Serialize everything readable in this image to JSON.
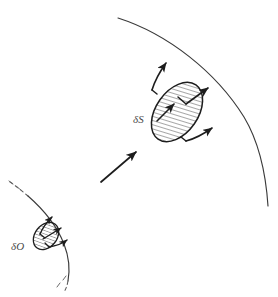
{
  "figure": {
    "background_color": "#ffffff",
    "stroke_color": "#262626",
    "curve_color": "#3a3a3a",
    "label_color": "#4a4a4a",
    "hatch_color": "#3a3a3a",
    "width": 278,
    "height": 297
  },
  "labels": {
    "surface_element": "δS",
    "solid_angle_element": "δO"
  },
  "elements": {
    "upper_arc": {
      "name": "outer-surface-arc",
      "style": "solid",
      "start": [
        118,
        18
      ],
      "end": [
        268,
        206
      ]
    },
    "lower_arc": {
      "name": "inner-surface-arc",
      "style": "dashed-ends",
      "start": [
        10,
        182
      ],
      "end": [
        74,
        292
      ]
    },
    "large_ellipse": {
      "name": "surface-area-patch",
      "center": [
        177,
        112
      ],
      "rx": 21,
      "ry": 33,
      "rotation_deg": 35,
      "fill": "hatched"
    },
    "small_ellipse": {
      "name": "solid-angle-patch",
      "center": [
        46,
        236
      ],
      "rx": 11,
      "ry": 15,
      "rotation_deg": 38,
      "fill": "hatched"
    },
    "connector_arrow": {
      "name": "projection-arrow",
      "start": [
        101,
        182
      ],
      "end": [
        138,
        151
      ]
    },
    "large_patch_normals": [
      {
        "name": "normal-vector-top",
        "start": [
          153,
          89
        ],
        "end": [
          167,
          62
        ]
      },
      {
        "name": "normal-vector-middle",
        "start": [
          158,
          120
        ],
        "end": [
          175,
          103
        ]
      },
      {
        "name": "normal-vector-right",
        "start": [
          188,
          141
        ],
        "end": [
          213,
          127
        ]
      }
    ],
    "small_patch_normals": [
      {
        "name": "ray-vector-top",
        "start": [
          41,
          233
        ],
        "end": [
          53,
          217
        ]
      },
      {
        "name": "ray-vector-middle",
        "start": [
          44,
          239
        ],
        "end": [
          62,
          228
        ]
      },
      {
        "name": "ray-vector-lower",
        "start": [
          50,
          246
        ],
        "end": [
          68,
          240
        ]
      }
    ]
  }
}
